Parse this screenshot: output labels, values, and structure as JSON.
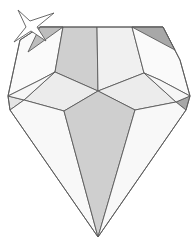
{
  "illustration": {
    "subject": "faceted diamond gem with sparkle star",
    "colors": {
      "background": "#ffffff",
      "outline": "#5a5a5a",
      "facet_light": "#f2f2f2",
      "facet_lighter": "#fafafa",
      "facet_mid": "#e4e4e4",
      "facet_dark": "#cfcfcf",
      "facet_darkest": "#a8a8a8",
      "star_fill": "#ffffff"
    },
    "elements": [
      "diamond",
      "sparkle-star"
    ]
  }
}
